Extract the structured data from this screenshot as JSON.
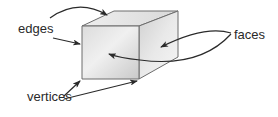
{
  "diagram": {
    "labels": {
      "edges": "edges",
      "vertices": "vertices",
      "faces": "faces"
    },
    "colors": {
      "cube_front_light": "#f2f2f2",
      "cube_front_dark": "#c4c4c4",
      "cube_top": "#e6e6e6",
      "cube_side": "#d8d8d8",
      "outline": "#6d6d6d",
      "arrow": "#2a2a2a",
      "text": "#2a2a2a"
    },
    "annotations": [
      {
        "label": "edges",
        "arrows": 2,
        "targets": [
          "top-front edge",
          "left-front edge"
        ]
      },
      {
        "label": "vertices",
        "arrows": 2,
        "targets": [
          "bottom-left vertex",
          "bottom-right vertex"
        ]
      },
      {
        "label": "faces",
        "arrows": 2,
        "targets": [
          "front face",
          "side face"
        ]
      }
    ]
  }
}
